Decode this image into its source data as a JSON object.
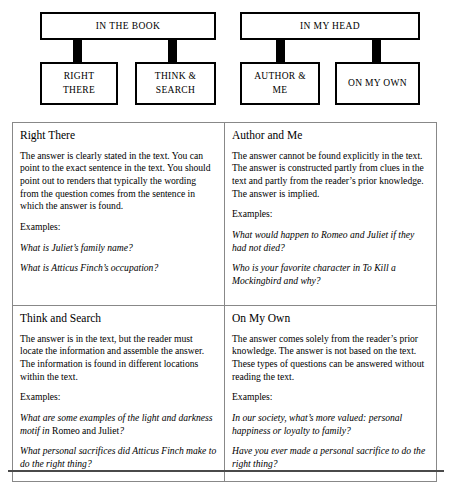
{
  "flowchart": {
    "groups": [
      {
        "title": "IN THE BOOK",
        "leaves": [
          {
            "line1": "RIGHT",
            "line2": "THERE"
          },
          {
            "line1": "THINK &",
            "line2": "SEARCH"
          }
        ]
      },
      {
        "title": "IN MY HEAD",
        "leaves": [
          {
            "line1": "AUTHOR &",
            "line2": "ME"
          },
          {
            "line1": "ON MY OWN",
            "line2": ""
          }
        ]
      }
    ]
  },
  "table": {
    "examples_label": "Examples:",
    "cells": [
      {
        "title": "Right There",
        "body": "The answer is clearly stated in the text. You can point to the exact sentence in the text. You should point out to renders that typically the wording from the question comes from the sentence in which the answer is found.",
        "examples": [
          {
            "text": "What is Juliet’s family name?"
          },
          {
            "text": "What is Atticus Finch’s occupation?"
          }
        ]
      },
      {
        "title": "Author and Me",
        "body": "The answer cannot be found explicitly in the text. The answer is constructed partly from clues in the text and partly from the reader’s prior knowledge. The answer is implied.",
        "examples": [
          {
            "text": "What would happen to Romeo and Juliet if they had not died?"
          },
          {
            "text": "Who is your favorite character in To Kill a Mockingbird and why?"
          }
        ]
      },
      {
        "title": "Think and Search",
        "body": "The answer is in the text, but the reader must locate the information and assemble the answer. The information is found in different locations within the text.",
        "examples": [
          {
            "pre": "What are some examples of the light and darkness motif in ",
            "upright": "Romeo",
            "mid": " and Juliet",
            "post": "?"
          },
          {
            "text": "What personal sacrifices did Atticus Finch make to do the right thing?"
          }
        ]
      },
      {
        "title": "On My Own",
        "body": "The answer comes solely from the reader’s prior knowledge. The answer is not based on the text. These types of questions can be answered without reading the text.",
        "examples": [
          {
            "text": "In our society, what’s more valued: personal happiness or loyalty to family?"
          },
          {
            "text": "Have you ever made a personal sacrifice to do the right thing?"
          }
        ]
      }
    ]
  }
}
